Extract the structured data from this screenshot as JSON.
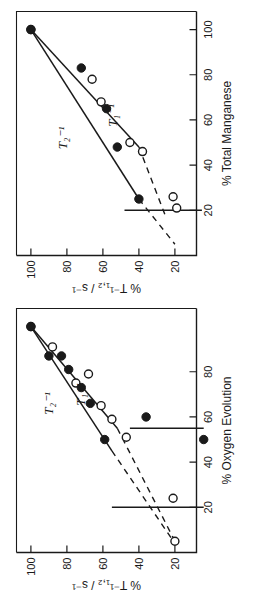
{
  "figure": {
    "kind": "two-panel-scatter",
    "background": "#ffffff",
    "ink": "#1a1a1a",
    "rotation_degrees": -90,
    "note_orientation": "panels are printed rotated 90 degrees counter-clockwise on the page"
  },
  "panels": [
    {
      "id": "top",
      "axis": {
        "x_label": "% Total Manganese",
        "y_label": "% T⁻¹₁,₂ / s⁻¹",
        "x_ticks": [
          20,
          40,
          60,
          80,
          100
        ],
        "y_ticks": [
          20,
          40,
          60,
          80,
          100
        ],
        "xlim": [
          0,
          108
        ],
        "ylim": [
          8,
          108
        ]
      },
      "annotations": [
        {
          "text": "T₁⁻¹",
          "x": 62,
          "y": 52
        },
        {
          "text": "T₂⁻¹",
          "x": 52,
          "y": 80
        }
      ]
    },
    {
      "id": "bottom",
      "axis": {
        "x_label": "% Oxygen Evolution",
        "y_label": "% T⁻¹₁,₂ / s⁻¹",
        "x_ticks": [
          20,
          40,
          60,
          80
        ],
        "y_ticks": [
          20,
          40,
          60,
          80,
          100
        ],
        "xlim": [
          0,
          108
        ],
        "ylim": [
          8,
          108
        ]
      },
      "annotations": [
        {
          "text": "T₁⁻¹",
          "x": 70,
          "y": 70
        },
        {
          "text": "T₂⁻¹",
          "x": 66,
          "y": 88
        }
      ]
    }
  ],
  "chart_data": [
    {
      "type": "scatter",
      "panel": "top",
      "title": "",
      "xlabel": "% Total Manganese",
      "ylabel": "% T⁻¹₁,₂ / s⁻¹",
      "xlim": [
        0,
        108
      ],
      "ylim": [
        8,
        108
      ],
      "xticks": [
        20,
        40,
        60,
        80,
        100
      ],
      "yticks": [
        20,
        40,
        60,
        80,
        100
      ],
      "grid": false,
      "legend": "inline-annotation",
      "series": [
        {
          "name": "T₁⁻¹",
          "marker": "open-circle",
          "points": [
            {
              "x": 100,
              "y": 100
            },
            {
              "x": 78,
              "y": 66
            },
            {
              "x": 68,
              "y": 61
            },
            {
              "x": 50,
              "y": 45
            },
            {
              "x": 46,
              "y": 38
            },
            {
              "x": 26,
              "y": 21
            },
            {
              "x": 21,
              "y": 19
            }
          ],
          "fit_line": {
            "style": "solid",
            "from": {
              "x": 100,
              "y": 100
            },
            "to": {
              "x": 48,
              "y": 40
            }
          },
          "fit_extension": {
            "style": "dashed",
            "from": {
              "x": 48,
              "y": 40
            },
            "to": {
              "x": 17,
              "y": 25
            }
          },
          "vertical_marker": {
            "style": "solid",
            "x_value": 20,
            "from_y": 48,
            "to_y": 5
          }
        },
        {
          "name": "T₂⁻¹",
          "marker": "filled-circle",
          "points": [
            {
              "x": 100,
              "y": 100
            },
            {
              "x": 83,
              "y": 72
            },
            {
              "x": 65,
              "y": 58
            },
            {
              "x": 48,
              "y": 52
            },
            {
              "x": 25,
              "y": 40
            }
          ],
          "fit_line": {
            "style": "solid",
            "from": {
              "x": 100,
              "y": 100
            },
            "to": {
              "x": 25,
              "y": 40
            }
          },
          "fit_extension": {
            "style": "dashed",
            "from": {
              "x": 25,
              "y": 40
            },
            "to": {
              "x": 5,
              "y": 20
            }
          }
        }
      ]
    },
    {
      "type": "scatter",
      "panel": "bottom",
      "title": "",
      "xlabel": "% Oxygen Evolution",
      "ylabel": "% T⁻¹₁,₂ / s⁻¹",
      "xlim": [
        0,
        108
      ],
      "ylim": [
        8,
        108
      ],
      "xticks": [
        20,
        40,
        60,
        80
      ],
      "yticks": [
        20,
        40,
        60,
        80,
        100
      ],
      "grid": false,
      "legend": "inline-annotation",
      "series": [
        {
          "name": "T₁⁻¹",
          "marker": "open-circle",
          "points": [
            {
              "x": 100,
              "y": 100
            },
            {
              "x": 91,
              "y": 88
            },
            {
              "x": 75,
              "y": 75
            },
            {
              "x": 65,
              "y": 61
            },
            {
              "x": 59,
              "y": 55
            },
            {
              "x": 79,
              "y": 68
            },
            {
              "x": 51,
              "y": 47
            },
            {
              "x": 24,
              "y": 21
            },
            {
              "x": 5,
              "y": 20
            }
          ],
          "fit_line": {
            "style": "solid",
            "from": {
              "x": 100,
              "y": 100
            },
            "to": {
              "x": 55,
              "y": 52
            }
          },
          "fit_extension": {
            "style": "dashed",
            "from": {
              "x": 55,
              "y": 52
            },
            "to": {
              "x": 5,
              "y": 20
            }
          },
          "vertical_marker": {
            "style": "solid",
            "x_value": 20,
            "from_y": 55,
            "to_y": 4
          }
        },
        {
          "name": "T₂⁻¹",
          "marker": "filled-circle",
          "points": [
            {
              "x": 100,
              "y": 100
            },
            {
              "x": 87,
              "y": 90
            },
            {
              "x": 87,
              "y": 83
            },
            {
              "x": 81,
              "y": 79
            },
            {
              "x": 73,
              "y": 72
            },
            {
              "x": 66,
              "y": 67
            },
            {
              "x": 50,
              "y": 59
            },
            {
              "x": 60,
              "y": 36
            },
            {
              "x": 50,
              "y": 4
            }
          ],
          "fit_line": {
            "style": "solid",
            "from": {
              "x": 100,
              "y": 100
            },
            "to": {
              "x": 45,
              "y": 55
            }
          },
          "fit_extension": {
            "style": "dashed",
            "from": {
              "x": 45,
              "y": 55
            },
            "to": {
              "x": 4,
              "y": 20
            }
          },
          "vertical_marker": {
            "style": "solid",
            "x_value": 55,
            "from_y": 45,
            "to_y": 4
          }
        }
      ]
    }
  ]
}
